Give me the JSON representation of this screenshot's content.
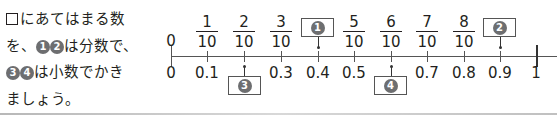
{
  "instruction": {
    "line1_box": "□",
    "line1_text": "にあてはまる数",
    "line2_pre": "を、",
    "line2_b1": "1",
    "line2_b2": "2",
    "line2_post": "は分数で、",
    "line3_b1": "3",
    "line3_b2": "4",
    "line3_post": "は小数でかき",
    "line4": "ましょう。"
  },
  "number_line": {
    "top_zero": "0",
    "top_one": "1",
    "fractions": [
      {
        "num": "1",
        "den": "10"
      },
      {
        "num": "2",
        "den": "10"
      },
      {
        "num": "3",
        "den": "10"
      },
      {
        "num": "5",
        "den": "10"
      },
      {
        "num": "6",
        "den": "10"
      },
      {
        "num": "7",
        "den": "10"
      },
      {
        "num": "8",
        "den": "10"
      }
    ],
    "decimals": [
      "0",
      "0.1",
      "0.3",
      "0.4",
      "0.5",
      "0.7",
      "0.8",
      "0.9",
      "1"
    ],
    "blanks": {
      "b1": {
        "label": "1",
        "position": 0.4,
        "side": "top"
      },
      "b2": {
        "label": "2",
        "position": 0.9,
        "side": "top"
      },
      "b3": {
        "label": "3",
        "position": 0.2,
        "side": "bottom"
      },
      "b4": {
        "label": "4",
        "position": 0.6,
        "side": "bottom"
      }
    }
  },
  "colors": {
    "text": "#231f20",
    "circle": "#6d6e70",
    "axis": "#555555"
  }
}
